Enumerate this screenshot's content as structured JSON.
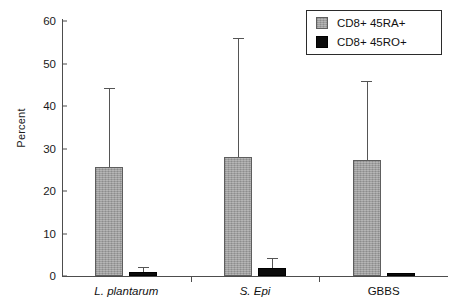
{
  "chart_data": {
    "type": "bar",
    "title": "",
    "xlabel": "",
    "ylabel": "Percent",
    "ylim": [
      0,
      60
    ],
    "yticks": [
      0,
      10,
      20,
      30,
      40,
      50,
      60
    ],
    "ytick_labels": [
      "0",
      "10",
      "20",
      "30",
      "40",
      "50",
      "60"
    ],
    "grid": false,
    "legend_position": "top-right",
    "categories": [
      "L. plantarum",
      "S. Epi",
      "GBBS"
    ],
    "category_styles": [
      "italic",
      "italic",
      "normal"
    ],
    "series": [
      {
        "name": "CD8+ 45RA+",
        "color": "#9d9d9d",
        "values": [
          25.7,
          28.0,
          27.4
        ],
        "errors_upper": [
          44.2,
          56.0,
          45.9
        ]
      },
      {
        "name": "CD8+ 45RO+",
        "color": "#0b0b0b",
        "values": [
          1.0,
          1.9,
          0.8
        ],
        "errors_upper": [
          2.1,
          4.2,
          0.8
        ]
      }
    ]
  },
  "legend": {
    "entries": [
      {
        "label": "CD8+ 45RA+",
        "swatch": "gray"
      },
      {
        "label": "CD8+ 45RO+",
        "swatch": "black"
      }
    ]
  },
  "axes": {
    "y_title": "Percent",
    "y_labels": [
      "60",
      "50",
      "40",
      "30",
      "20",
      "10",
      "0"
    ],
    "x_labels": [
      "L. plantarum",
      "S. Epi",
      "GBBS"
    ]
  }
}
